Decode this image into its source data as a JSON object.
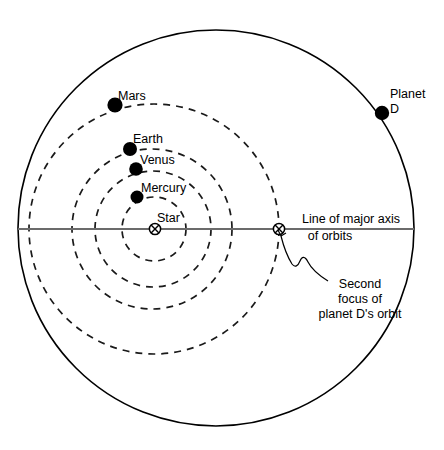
{
  "diagram": {
    "background_color": "#ffffff",
    "stroke_color": "#000000",
    "axis_color": "#6b6b6b",
    "labels": {
      "mars": "Mars",
      "earth": "Earth",
      "venus": "Venus",
      "mercury": "Mercury",
      "star": "Star",
      "planet_d_line1": "Planet",
      "planet_d_line2": "D",
      "major_axis_line1": "Line of major axis",
      "major_axis_line2": "of orbits",
      "second_focus_line1": "Second",
      "second_focus_line2": "focus of",
      "second_focus_line3": "planet D's orbit"
    },
    "bodies": [
      {
        "name": "Star",
        "symbol": "circled-cross",
        "x": 155,
        "y": 229
      },
      {
        "name": "Mercury",
        "symbol": "filled-dot",
        "x": 137,
        "y": 197,
        "radius": 6.5
      },
      {
        "name": "Venus",
        "symbol": "filled-dot",
        "x": 136,
        "y": 169,
        "radius": 6.8
      },
      {
        "name": "Earth",
        "symbol": "filled-dot",
        "x": 130,
        "y": 149,
        "radius": 7.0
      },
      {
        "name": "Mars",
        "symbol": "filled-dot",
        "x": 115,
        "y": 105,
        "radius": 7.6
      },
      {
        "name": "Planet D",
        "symbol": "filled-dot",
        "x": 382,
        "y": 113,
        "radius": 7.2
      },
      {
        "name": "Second focus of planet D's orbit",
        "symbol": "circled-cross",
        "x": 279,
        "y": 229
      }
    ],
    "orbits": [
      {
        "name": "Planet D orbit",
        "style": "solid",
        "center_x": 216,
        "center_y": 228,
        "radius": 198
      },
      {
        "name": "Mars orbit",
        "style": "dashed",
        "center_x": 154,
        "center_y": 229,
        "radius": 125
      },
      {
        "name": "Earth orbit",
        "style": "dashed",
        "center_x": 152,
        "center_y": 229,
        "radius": 80
      },
      {
        "name": "Venus orbit",
        "style": "dashed",
        "center_x": 153,
        "center_y": 229,
        "radius": 58
      },
      {
        "name": "Mercury orbit",
        "style": "dashed",
        "center_x": 154,
        "center_y": 229,
        "radius": 32
      }
    ],
    "axis": {
      "name": "Line of major axis of orbits",
      "x1": 18,
      "y1": 229,
      "x2": 414,
      "y2": 229
    }
  }
}
